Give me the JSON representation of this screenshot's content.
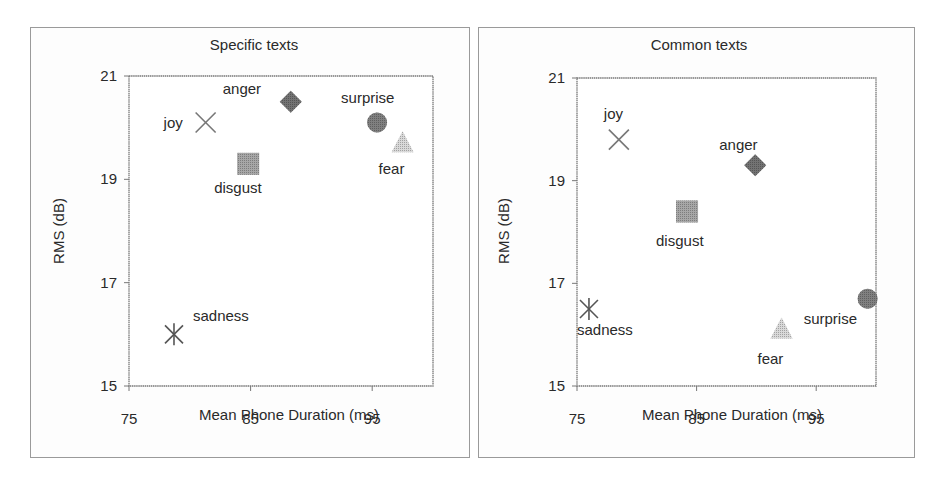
{
  "chart_data": [
    {
      "type": "scatter",
      "title": "Specific texts",
      "xlabel": "Mean Phone Duration (ms)",
      "ylabel": "RMS (dB)",
      "xlim": [
        75,
        100
      ],
      "ylim": [
        15,
        21
      ],
      "xticks": [
        75,
        85,
        95
      ],
      "yticks": [
        15,
        17,
        19,
        21
      ],
      "grid": false,
      "legend": "none (points labeled directly)",
      "points": [
        {
          "label": "joy",
          "x": 81.3,
          "y": 20.1,
          "marker": "x",
          "color": "#777777",
          "label_pos": "left"
        },
        {
          "label": "anger",
          "x": 88.3,
          "y": 20.5,
          "marker": "diamond",
          "color": "#444444",
          "label_pos": "upper-left"
        },
        {
          "label": "surprise",
          "x": 95.4,
          "y": 20.1,
          "marker": "circle",
          "color": "#555555",
          "label_pos": "above"
        },
        {
          "label": "fear",
          "x": 97.5,
          "y": 19.7,
          "marker": "triangle",
          "color": "#cccccc",
          "label_pos": "below"
        },
        {
          "label": "disgust",
          "x": 84.8,
          "y": 19.3,
          "marker": "square",
          "color": "#8a8a8a",
          "label_pos": "below"
        },
        {
          "label": "sadness",
          "x": 78.7,
          "y": 16.0,
          "marker": "asterisk",
          "color": "#555555",
          "label_pos": "upper-right"
        }
      ]
    },
    {
      "type": "scatter",
      "title": "Common texts",
      "xlabel": "Mean Phone Duration (ms)",
      "ylabel": "RMS (dB)",
      "xlim": [
        75,
        100
      ],
      "ylim": [
        15,
        21
      ],
      "xticks": [
        75,
        85,
        95
      ],
      "yticks": [
        15,
        17,
        19,
        21
      ],
      "grid": false,
      "legend": "none (points labeled directly)",
      "points": [
        {
          "label": "joy",
          "x": 78.5,
          "y": 19.8,
          "marker": "x",
          "color": "#777777",
          "label_pos": "above"
        },
        {
          "label": "anger",
          "x": 89.9,
          "y": 19.3,
          "marker": "diamond",
          "color": "#444444",
          "label_pos": "above"
        },
        {
          "label": "disgust",
          "x": 84.2,
          "y": 18.4,
          "marker": "square",
          "color": "#8a8a8a",
          "label_pos": "below"
        },
        {
          "label": "sadness",
          "x": 76.0,
          "y": 16.5,
          "marker": "asterisk",
          "color": "#555555",
          "label_pos": "below"
        },
        {
          "label": "fear",
          "x": 92.1,
          "y": 16.1,
          "marker": "triangle",
          "color": "#cccccc",
          "label_pos": "below"
        },
        {
          "label": "surprise",
          "x": 99.3,
          "y": 16.7,
          "marker": "circle",
          "color": "#555555",
          "label_pos": "lower-left"
        }
      ]
    }
  ],
  "layout": [
    {
      "panel": {
        "left": 30,
        "top": 27,
        "width": 440,
        "height": 431
      },
      "plot": {
        "left": 129,
        "top": 76,
        "right": 433,
        "bottom": 386
      },
      "title_pos": {
        "x": 254,
        "y": 36
      },
      "ylabel_pos": {
        "x": 58,
        "y": 231
      },
      "xlabel_pos": {
        "x": 289,
        "y": 406
      }
    },
    {
      "panel": {
        "left": 478,
        "top": 27,
        "width": 437,
        "height": 431
      },
      "plot": {
        "left": 577,
        "top": 78,
        "right": 876,
        "bottom": 386
      },
      "title_pos": {
        "x": 699,
        "y": 36
      },
      "ylabel_pos": {
        "x": 503,
        "y": 231
      },
      "xlabel_pos": {
        "x": 732,
        "y": 406
      }
    }
  ],
  "label_offsets": [
    {
      "joy": [
        -42,
        5
      ],
      "anger": [
        -68,
        -8
      ],
      "surprise": [
        -36,
        -20
      ],
      "fear": [
        -24,
        31
      ],
      "disgust": [
        -34,
        29
      ],
      "sadness": [
        19,
        -13
      ]
    },
    {
      "joy": [
        -15,
        -21
      ],
      "anger": [
        -36,
        -15
      ],
      "disgust": [
        -31,
        35
      ],
      "sadness": [
        -12,
        26
      ],
      "fear": [
        -24,
        34
      ],
      "surprise": [
        -64,
        25
      ]
    }
  ]
}
